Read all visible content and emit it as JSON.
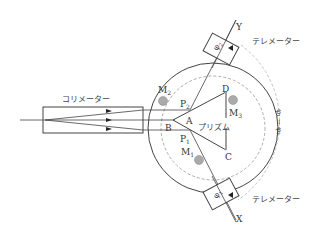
{
  "diagram": {
    "title": "",
    "colors": {
      "line": "#444444",
      "dashed": "#999999",
      "mirror_fill": "#aaaaaa",
      "background": "#ffffff"
    },
    "labels": {
      "collimator": "コリメーター",
      "telescope_top": "テレメーター",
      "telescope_bottom": "テレメーター",
      "prism": "プリズム",
      "axis_y": "Y",
      "axis_x": "X",
      "vertex_a": "A",
      "vertex_b": "B",
      "vertex_c": "C",
      "vertex_d": "D",
      "point_p1": "P",
      "point_p1_sub": "1",
      "point_p2": "P",
      "point_p2_sub": "2",
      "mirror_m1": "M",
      "mirror_m1_sub": "1",
      "mirror_m2": "M",
      "mirror_m2_sub": "2",
      "mirror_m3": "M",
      "mirror_m3_sub": "3",
      "angle_phi1": "φ",
      "angle_phi1_sub": "1",
      "angle_phi2": "φ",
      "angle_phi2_sub": "2",
      "angle_diff": "φ₁ − φ₂"
    }
  }
}
